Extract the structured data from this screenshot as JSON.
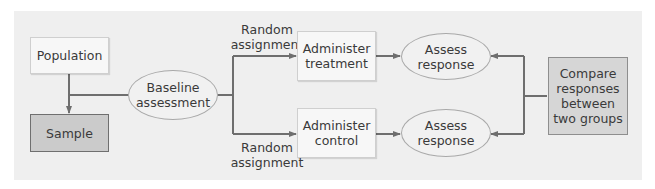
{
  "diagram": {
    "type": "flowchart",
    "title": "",
    "nodes": {
      "population": "Population",
      "sample": "Sample",
      "baseline": [
        "Baseline",
        "assessment"
      ],
      "treatment": [
        "Administer",
        "treatment"
      ],
      "control": [
        "Administer",
        "control"
      ],
      "assess_top": [
        "Assess",
        "response"
      ],
      "assess_bottom": [
        "Assess",
        "response"
      ],
      "compare": [
        "Compare",
        "responses",
        "between",
        "two groups"
      ]
    },
    "edge_labels": {
      "random_top": [
        "Random",
        "assignment"
      ],
      "random_bottom": [
        "Random",
        "assignment"
      ]
    },
    "edges": [
      {
        "from": "population",
        "to": "sample"
      },
      {
        "from": "sample_line",
        "to": "baseline"
      },
      {
        "from": "baseline",
        "to": "treatment",
        "label": "Random assignment"
      },
      {
        "from": "baseline",
        "to": "control",
        "label": "Random assignment"
      },
      {
        "from": "treatment",
        "to": "assess_top"
      },
      {
        "from": "control",
        "to": "assess_bottom"
      },
      {
        "from": "compare",
        "to": "assess_top"
      },
      {
        "from": "compare",
        "to": "assess_bottom"
      }
    ],
    "colors": {
      "panel": "#efefef",
      "line": "#6e6e6e",
      "dark_box": "#cbcbcb",
      "light_box": "#f7f7f7"
    }
  }
}
